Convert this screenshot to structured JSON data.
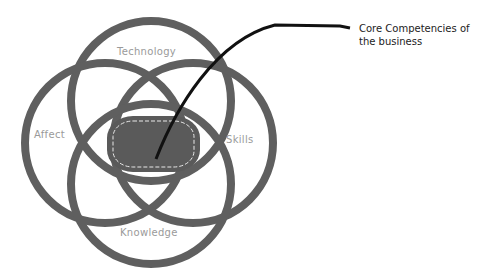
{
  "diagram": {
    "type": "venn",
    "circles": [
      {
        "id": "technology",
        "label": "Technology",
        "cx": 151,
        "cy": 101,
        "r": 80
      },
      {
        "id": "affect",
        "label": "Affect",
        "cx": 105,
        "cy": 143,
        "r": 80
      },
      {
        "id": "skills",
        "label": "Skills",
        "cx": 193,
        "cy": 143,
        "r": 80
      },
      {
        "id": "knowledge",
        "label": "Knowledge",
        "cx": 151,
        "cy": 184,
        "r": 80
      }
    ],
    "center": {
      "label": "Core Competencies of the business"
    },
    "callout": {
      "line1": "Core Competencies of",
      "line2": "the business"
    },
    "colors": {
      "ring": "#5f5f5f",
      "core": "#5a5a5a",
      "label": "#9a9a9a",
      "leader": "#111111"
    }
  }
}
